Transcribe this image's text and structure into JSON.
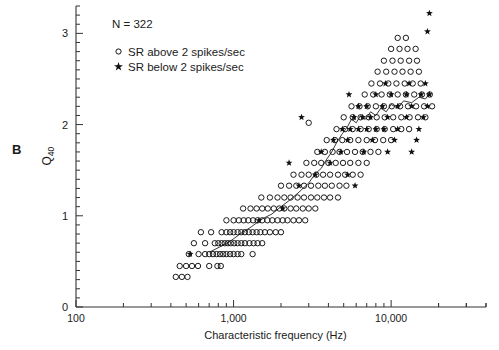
{
  "panel": {
    "label": "B"
  },
  "annotations": {
    "sample_size": "N = 322"
  },
  "legend": {
    "entries": [
      {
        "marker": "open-circle",
        "label": "SR above 2 spikes/sec"
      },
      {
        "marker": "filled-star",
        "label": "SR below 2 spikes/sec"
      }
    ]
  },
  "axes": {
    "x": {
      "label": "Characteristic frequency (Hz)",
      "scale": "log",
      "min": 100,
      "max": 40000,
      "tick_labels": [
        "100",
        "1,000",
        "10,000"
      ],
      "tick_values": [
        100,
        1000,
        10000
      ]
    },
    "y": {
      "label_main": "Q",
      "label_sub": "40",
      "scale": "linear",
      "min": 0,
      "max": 3.3,
      "tick_labels": [
        "0",
        "1",
        "2",
        "3"
      ],
      "tick_values": [
        0,
        1,
        2,
        3
      ],
      "minor_step": 0.1
    }
  },
  "style": {
    "axis_color": "#333333",
    "marker_color": "#111111",
    "trend_color": "#222222",
    "background": "#ffffff"
  },
  "chart_data": {
    "type": "scatter",
    "title": "",
    "xlabel": "Characteristic frequency (Hz)",
    "ylabel": "Q40",
    "xscale": "log",
    "xlim": [
      100,
      40000
    ],
    "ylim": [
      0,
      3.3
    ],
    "grid": false,
    "legend_position": "top-left",
    "annotation": "N = 322",
    "series": [
      {
        "name": "SR above 2 spikes/sec",
        "marker": "open-circle",
        "points": [
          [
            430,
            0.33
          ],
          [
            470,
            0.33
          ],
          [
            510,
            0.33
          ],
          [
            455,
            0.45
          ],
          [
            500,
            0.45
          ],
          [
            545,
            0.45
          ],
          [
            595,
            0.45
          ],
          [
            700,
            0.45
          ],
          [
            790,
            0.45
          ],
          [
            830,
            0.45
          ],
          [
            520,
            0.58
          ],
          [
            600,
            0.58
          ],
          [
            660,
            0.58
          ],
          [
            700,
            0.58
          ],
          [
            740,
            0.58
          ],
          [
            780,
            0.58
          ],
          [
            820,
            0.58
          ],
          [
            860,
            0.58
          ],
          [
            900,
            0.58
          ],
          [
            950,
            0.58
          ],
          [
            1000,
            0.58
          ],
          [
            1060,
            0.58
          ],
          [
            1120,
            0.58
          ],
          [
            1320,
            0.58
          ],
          [
            560,
            0.7
          ],
          [
            660,
            0.7
          ],
          [
            760,
            0.7
          ],
          [
            800,
            0.7
          ],
          [
            840,
            0.7
          ],
          [
            880,
            0.7
          ],
          [
            920,
            0.7
          ],
          [
            960,
            0.7
          ],
          [
            1010,
            0.7
          ],
          [
            1060,
            0.7
          ],
          [
            1120,
            0.7
          ],
          [
            1180,
            0.7
          ],
          [
            1260,
            0.7
          ],
          [
            1340,
            0.7
          ],
          [
            1420,
            0.7
          ],
          [
            1520,
            0.7
          ],
          [
            620,
            0.82
          ],
          [
            720,
            0.82
          ],
          [
            840,
            0.82
          ],
          [
            900,
            0.82
          ],
          [
            950,
            0.82
          ],
          [
            1000,
            0.82
          ],
          [
            1060,
            0.82
          ],
          [
            1120,
            0.82
          ],
          [
            1180,
            0.82
          ],
          [
            1250,
            0.82
          ],
          [
            1320,
            0.82
          ],
          [
            1400,
            0.82
          ],
          [
            1480,
            0.82
          ],
          [
            1580,
            0.82
          ],
          [
            1700,
            0.82
          ],
          [
            1850,
            0.82
          ],
          [
            2000,
            0.82
          ],
          [
            900,
            0.95
          ],
          [
            1000,
            0.95
          ],
          [
            1080,
            0.95
          ],
          [
            1160,
            0.95
          ],
          [
            1240,
            0.95
          ],
          [
            1330,
            0.95
          ],
          [
            1420,
            0.95
          ],
          [
            1520,
            0.95
          ],
          [
            1640,
            0.95
          ],
          [
            1760,
            0.95
          ],
          [
            1900,
            0.95
          ],
          [
            2050,
            0.95
          ],
          [
            2200,
            0.95
          ],
          [
            2400,
            0.95
          ],
          [
            2600,
            0.95
          ],
          [
            2850,
            0.95
          ],
          [
            1150,
            1.08
          ],
          [
            1280,
            1.08
          ],
          [
            1400,
            1.08
          ],
          [
            1520,
            1.08
          ],
          [
            1650,
            1.08
          ],
          [
            1800,
            1.08
          ],
          [
            1950,
            1.08
          ],
          [
            2100,
            1.08
          ],
          [
            2300,
            1.08
          ],
          [
            2500,
            1.08
          ],
          [
            2750,
            1.08
          ],
          [
            3000,
            1.08
          ],
          [
            3300,
            1.08
          ],
          [
            1500,
            1.2
          ],
          [
            1700,
            1.2
          ],
          [
            1900,
            1.2
          ],
          [
            2100,
            1.2
          ],
          [
            2300,
            1.2
          ],
          [
            2550,
            1.2
          ],
          [
            2800,
            1.2
          ],
          [
            3100,
            1.2
          ],
          [
            3400,
            1.2
          ],
          [
            3750,
            1.2
          ],
          [
            4100,
            1.2
          ],
          [
            4600,
            1.2
          ],
          [
            2000,
            1.33
          ],
          [
            2250,
            1.33
          ],
          [
            2500,
            1.33
          ],
          [
            2800,
            1.33
          ],
          [
            3100,
            1.33
          ],
          [
            3450,
            1.33
          ],
          [
            3800,
            1.33
          ],
          [
            4200,
            1.33
          ],
          [
            4700,
            1.33
          ],
          [
            5200,
            1.33
          ],
          [
            2400,
            1.45
          ],
          [
            2700,
            1.45
          ],
          [
            3000,
            1.45
          ],
          [
            3350,
            1.45
          ],
          [
            3700,
            1.45
          ],
          [
            4100,
            1.45
          ],
          [
            4600,
            1.45
          ],
          [
            5100,
            1.45
          ],
          [
            5700,
            1.45
          ],
          [
            6400,
            1.45
          ],
          [
            2900,
            1.58
          ],
          [
            3250,
            1.58
          ],
          [
            3600,
            1.58
          ],
          [
            4000,
            1.58
          ],
          [
            4450,
            1.58
          ],
          [
            4950,
            1.58
          ],
          [
            5500,
            1.58
          ],
          [
            6200,
            1.58
          ],
          [
            7000,
            1.58
          ],
          [
            3400,
            1.7
          ],
          [
            3800,
            1.7
          ],
          [
            4250,
            1.7
          ],
          [
            4700,
            1.7
          ],
          [
            5250,
            1.7
          ],
          [
            5900,
            1.7
          ],
          [
            6600,
            1.7
          ],
          [
            7400,
            1.7
          ],
          [
            8300,
            1.7
          ],
          [
            3900,
            1.83
          ],
          [
            4400,
            1.83
          ],
          [
            4900,
            1.83
          ],
          [
            5500,
            1.83
          ],
          [
            6200,
            1.83
          ],
          [
            7000,
            1.83
          ],
          [
            7900,
            1.83
          ],
          [
            8900,
            1.83
          ],
          [
            10000,
            1.83
          ],
          [
            4500,
            1.95
          ],
          [
            5100,
            1.95
          ],
          [
            5700,
            1.95
          ],
          [
            6400,
            1.95
          ],
          [
            7200,
            1.95
          ],
          [
            8100,
            1.95
          ],
          [
            9100,
            1.95
          ],
          [
            10300,
            1.95
          ],
          [
            11600,
            1.95
          ],
          [
            13000,
            1.95
          ],
          [
            3000,
            2.02
          ],
          [
            5000,
            2.08
          ],
          [
            5700,
            2.08
          ],
          [
            6400,
            2.08
          ],
          [
            7200,
            2.08
          ],
          [
            8100,
            2.08
          ],
          [
            9100,
            2.08
          ],
          [
            10300,
            2.08
          ],
          [
            11600,
            2.08
          ],
          [
            13100,
            2.08
          ],
          [
            14800,
            2.08
          ],
          [
            16500,
            2.08
          ],
          [
            5600,
            2.2
          ],
          [
            6300,
            2.2
          ],
          [
            7100,
            2.2
          ],
          [
            8000,
            2.2
          ],
          [
            9000,
            2.2
          ],
          [
            10100,
            2.2
          ],
          [
            11400,
            2.2
          ],
          [
            12800,
            2.2
          ],
          [
            14400,
            2.2
          ],
          [
            16200,
            2.2
          ],
          [
            18200,
            2.2
          ],
          [
            6800,
            2.33
          ],
          [
            7700,
            2.33
          ],
          [
            8700,
            2.33
          ],
          [
            9800,
            2.33
          ],
          [
            11000,
            2.33
          ],
          [
            12400,
            2.33
          ],
          [
            14000,
            2.33
          ],
          [
            15700,
            2.33
          ],
          [
            17600,
            2.33
          ],
          [
            7500,
            2.45
          ],
          [
            8500,
            2.45
          ],
          [
            9600,
            2.45
          ],
          [
            10800,
            2.45
          ],
          [
            12200,
            2.45
          ],
          [
            13700,
            2.45
          ],
          [
            15400,
            2.45
          ],
          [
            8200,
            2.58
          ],
          [
            9300,
            2.58
          ],
          [
            10500,
            2.58
          ],
          [
            11800,
            2.58
          ],
          [
            13300,
            2.58
          ],
          [
            15000,
            2.58
          ],
          [
            9000,
            2.7
          ],
          [
            10200,
            2.7
          ],
          [
            11500,
            2.7
          ],
          [
            13000,
            2.7
          ],
          [
            14600,
            2.7
          ],
          [
            10000,
            2.83
          ],
          [
            11300,
            2.83
          ],
          [
            12700,
            2.83
          ],
          [
            14300,
            2.83
          ],
          [
            11000,
            2.95
          ],
          [
            12400,
            2.95
          ]
        ]
      },
      {
        "name": "SR below 2 spikes/sec",
        "marker": "filled-star",
        "points": [
          [
            530,
            0.58
          ],
          [
            1450,
            0.95
          ],
          [
            2050,
            1.08
          ],
          [
            2600,
            1.33
          ],
          [
            3300,
            1.45
          ],
          [
            2250,
            1.58
          ],
          [
            4100,
            1.58
          ],
          [
            5300,
            1.45
          ],
          [
            5900,
            1.33
          ],
          [
            3600,
            1.7
          ],
          [
            4800,
            1.7
          ],
          [
            6700,
            1.7
          ],
          [
            9500,
            1.7
          ],
          [
            13500,
            1.7
          ],
          [
            4300,
            1.83
          ],
          [
            5300,
            1.83
          ],
          [
            7600,
            1.83
          ],
          [
            10500,
            1.83
          ],
          [
            14500,
            1.83
          ],
          [
            4900,
            1.95
          ],
          [
            5500,
            1.95
          ],
          [
            6200,
            1.95
          ],
          [
            7000,
            1.95
          ],
          [
            8000,
            1.95
          ],
          [
            9000,
            1.95
          ],
          [
            11000,
            1.95
          ],
          [
            15000,
            1.95
          ],
          [
            2700,
            2.08
          ],
          [
            5800,
            2.08
          ],
          [
            6600,
            2.08
          ],
          [
            7400,
            2.08
          ],
          [
            9500,
            2.08
          ],
          [
            12500,
            2.08
          ],
          [
            16000,
            2.08
          ],
          [
            6200,
            2.2
          ],
          [
            7000,
            2.2
          ],
          [
            8800,
            2.2
          ],
          [
            11000,
            2.2
          ],
          [
            13500,
            2.2
          ],
          [
            17000,
            2.2
          ],
          [
            5400,
            2.33
          ],
          [
            8000,
            2.33
          ],
          [
            10000,
            2.33
          ],
          [
            12500,
            2.33
          ],
          [
            15500,
            2.33
          ],
          [
            17500,
            2.33
          ],
          [
            9200,
            2.45
          ],
          [
            13000,
            2.45
          ],
          [
            16500,
            2.45
          ],
          [
            17000,
            3.02
          ],
          [
            17500,
            3.22
          ]
        ]
      }
    ],
    "trend_line": {
      "name": "running-median-trend",
      "points": [
        [
          700,
          0.6
        ],
        [
          820,
          0.66
        ],
        [
          950,
          0.72
        ],
        [
          1100,
          0.8
        ],
        [
          1300,
          0.88
        ],
        [
          1500,
          0.96
        ],
        [
          1750,
          1.02
        ],
        [
          2000,
          1.1
        ],
        [
          2300,
          1.18
        ],
        [
          2600,
          1.26
        ],
        [
          3000,
          1.36
        ],
        [
          3300,
          1.46
        ],
        [
          3600,
          1.52
        ],
        [
          3900,
          1.62
        ],
        [
          4200,
          1.7
        ],
        [
          4500,
          1.8
        ],
        [
          4900,
          1.9
        ],
        [
          5300,
          1.98
        ],
        [
          5600,
          2.06
        ],
        [
          6000,
          2.02
        ],
        [
          6400,
          2.1
        ],
        [
          6900,
          2.06
        ],
        [
          7400,
          2.14
        ],
        [
          8000,
          2.1
        ],
        [
          8600,
          2.18
        ],
        [
          9300,
          2.14
        ],
        [
          10000,
          2.22
        ],
        [
          11000,
          2.18
        ],
        [
          12000,
          2.26
        ],
        [
          13500,
          2.24
        ],
        [
          15000,
          2.3
        ],
        [
          16500,
          2.28
        ],
        [
          17500,
          2.34
        ]
      ]
    }
  }
}
